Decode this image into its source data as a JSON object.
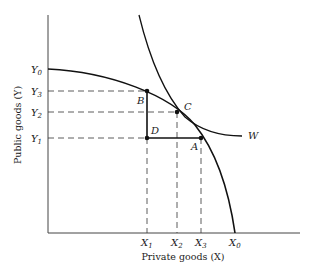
{
  "diagram": {
    "y_axis_label": "Public goods (Y)",
    "x_axis_label": "Private goods (X)",
    "y_ticks": [
      {
        "main": "Y",
        "sub": "0",
        "y": 69
      },
      {
        "main": "Y",
        "sub": "3",
        "y": 91
      },
      {
        "main": "Y",
        "sub": "2",
        "y": 112
      },
      {
        "main": "Y",
        "sub": "1",
        "y": 138
      }
    ],
    "x_ticks": [
      {
        "main": "X",
        "sub": "1",
        "x": 147
      },
      {
        "main": "X",
        "sub": "2",
        "x": 177
      },
      {
        "main": "X",
        "sub": "3",
        "x": 201
      },
      {
        "main": "X",
        "sub": "0",
        "x": 235
      }
    ],
    "points": {
      "A": "A",
      "B": "B",
      "C": "C",
      "D": "D"
    },
    "curve_label": "W"
  }
}
